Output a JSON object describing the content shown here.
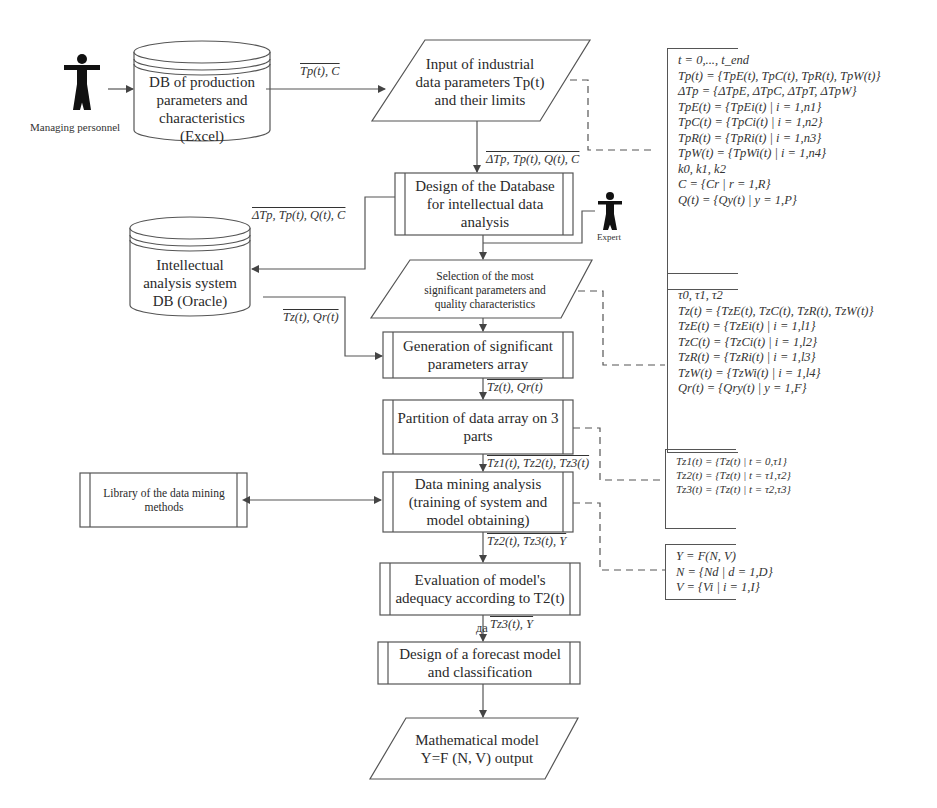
{
  "actors": {
    "managing_personnel": "Managing personnel",
    "expert": "Expert"
  },
  "nodes": {
    "db_production": "DB of production parameters and characteristics (Excel)",
    "input_params": "Input of industrial data parameters Tp(t) and their limits",
    "design_db": "Design of the Database for intellectual data analysis",
    "ias_db": "Intellectual analysis system DB (Oracle)",
    "selection": "Selection of the most significant parameters and quality characteristics",
    "generation": "Generation of significant parameters array",
    "partition": "Partition of data array on 3 parts",
    "library": "Library of the data mining methods",
    "data_mining": "Data mining analysis (training of system and model obtaining)",
    "evaluation": "Evaluation of model's adequacy according to T2(t)",
    "forecast": "Design of a forecast model and classification",
    "output": "Mathematical model Y=F (N, V) output"
  },
  "edge_labels": {
    "db_to_input": "Tp(t), C",
    "input_to_design": "ΔTp, Tp(t), Q(t), C",
    "design_to_ias": "ΔTp, Tp(t), Q(t), C",
    "ias_to_generation": "Tz(t), Qr(t)",
    "generation_to_partition": "Tz(t), Qr(t)",
    "partition_to_mining": "Tz1(t), Tz2(t), Tz3(t)",
    "mining_to_evaluation": "Tz2(t), Tz3(t), Y",
    "evaluation_to_forecast": "Tz3(t), Y",
    "evaluation_small": "да"
  },
  "formulas": {
    "input_block": [
      "t = 0,..., t_end",
      "Tp(t) = {TpE(t), TpC(t), TpR(t), TpW(t)}",
      "ΔTp = {ΔTpE, ΔTpC, ΔTpT, ΔTpW}",
      "TpE(t) = {TpEi(t) | i = 1,n1}",
      "TpC(t) = {TpCi(t) | i = 1,n2}",
      "TpR(t) = {TpRi(t) | i = 1,n3}",
      "TpW(t) = {TpWi(t) | i = 1,n4}",
      "k0, k1, k2",
      "C = {Cr | r = 1,R}",
      "Q(t) = {Qy(t) | y = 1,P}"
    ],
    "selection_block": [
      "τ0, τ1, τ2",
      "Tz(t) = {TzE(t), TzC(t), TzR(t), TzW(t)}",
      "TzE(t) = {TzEi(t) | i = 1,l1}",
      "TzC(t) = {TzCi(t) | i = 1,l2}",
      "TzR(t) = {TzRi(t) | i = 1,l3}",
      "TzW(t) = {TzWi(t) | i = 1,l4}",
      "Qr(t) = {Qry(t) | y = 1,F}"
    ],
    "partition_block": [
      "Tz1(t) = {Tz(t) | t = 0,τ1}",
      "Tz2(t) = {Tz(t) | t = τ1,τ2}",
      "Tz3(t) = {Tz(t) | t = τ2,τ3}"
    ],
    "model_block": [
      "Y = F(N, V)",
      "N = {Nd | d = 1,D}",
      "V = {Vi | i = 1,I}"
    ]
  }
}
